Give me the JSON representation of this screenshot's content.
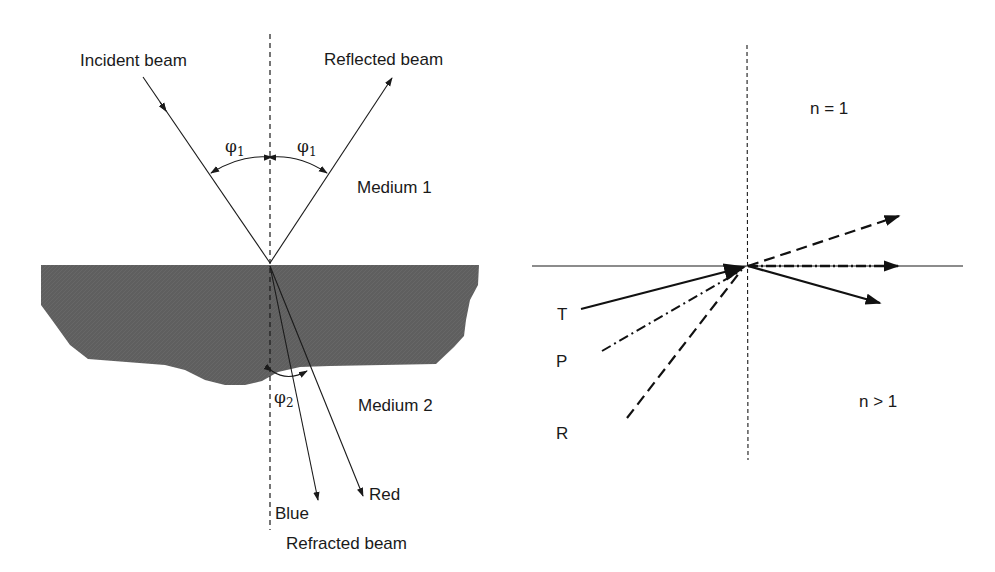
{
  "left_diagram": {
    "labels": {
      "incident": "Incident beam",
      "reflected": "Reflected beam",
      "medium1": "Medium 1",
      "medium2": "Medium 2",
      "blue": "Blue",
      "red": "Red",
      "refracted": "Refracted beam",
      "phi_symbol": "φ",
      "phi1_sub": "1",
      "phi2_sub": "2"
    },
    "colors": {
      "medium2_fill": "#5e5e5e",
      "line": "#1a1a1a"
    }
  },
  "right_diagram": {
    "labels": {
      "n_top": "n = 1",
      "n_bottom": "n > 1",
      "t": "T",
      "p": "P",
      "r": "R"
    },
    "rays": [
      {
        "name": "T",
        "style": "solid"
      },
      {
        "name": "P",
        "style": "dash-dot"
      },
      {
        "name": "R",
        "style": "dashed"
      }
    ]
  }
}
